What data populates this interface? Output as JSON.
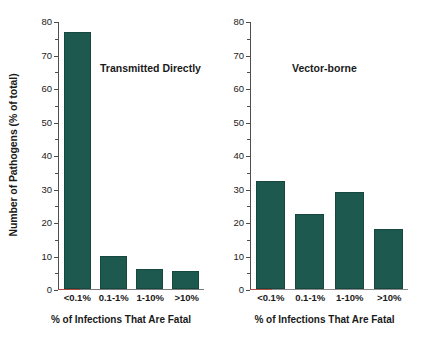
{
  "chart_data": [
    {
      "type": "bar",
      "title": "Transmitted Directly",
      "categories": [
        "<0.1%",
        "0.1-1%",
        "1-10%",
        ">10%"
      ],
      "values": [
        77,
        10,
        6,
        5.5
      ],
      "xlabel": "% of Infections That Are Fatal",
      "ylabel": "Number of Pathogens (% of total)",
      "ylim": [
        0,
        80
      ],
      "yticks": [
        0,
        10,
        20,
        30,
        40,
        50,
        60,
        70,
        80
      ],
      "yticklabels": [
        "0",
        "10",
        "20",
        "30",
        "40",
        "50",
        "60",
        "70",
        "80"
      ],
      "minor_ticks": true,
      "grid": false,
      "legend": "none",
      "bar_color": "#1d594f"
    },
    {
      "type": "bar",
      "title": "Vector-borne",
      "categories": [
        "<0.1%",
        "0.1-1%",
        "1-10%",
        ">10%"
      ],
      "values": [
        32.5,
        22.5,
        29,
        18
      ],
      "xlabel": "% of Infections That Are Fatal",
      "ylabel": "",
      "ylim": [
        0,
        80
      ],
      "yticks": [
        0,
        10,
        20,
        30,
        40,
        50,
        60,
        70,
        80
      ],
      "yticklabels": [
        "0",
        "10",
        "20",
        "30",
        "40",
        "50",
        "60",
        "70",
        "80"
      ],
      "minor_ticks": true,
      "grid": false,
      "legend": "none",
      "bar_color": "#1d594f"
    }
  ],
  "figure": {
    "shared_ylabel": "Number of Pathogens (% of total)",
    "shared_xlabel": "% of Infections That Are Fatal"
  }
}
